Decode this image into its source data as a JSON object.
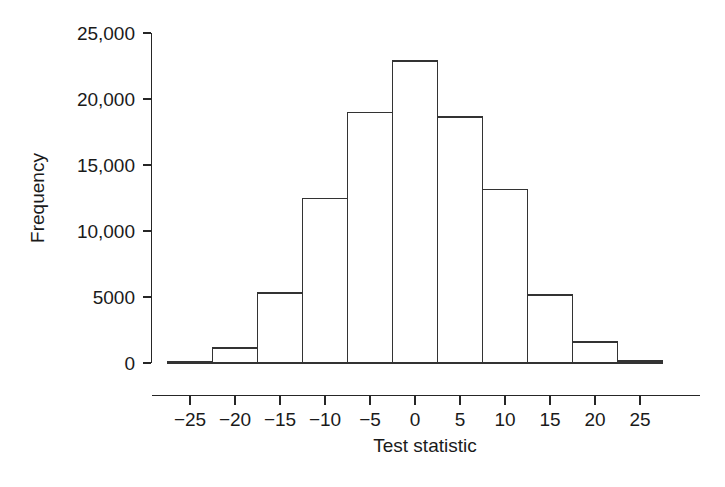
{
  "chart_data": {
    "type": "bar",
    "title": "",
    "xlabel": "Test statistic",
    "ylabel": "Frequency",
    "xlim": [
      -27.5,
      27.5
    ],
    "ylim": [
      0,
      25000
    ],
    "grid": false,
    "legend": null,
    "bin_width": 5,
    "xtick_values": [
      -25,
      -20,
      -15,
      -10,
      -5,
      0,
      5,
      10,
      15,
      20,
      25
    ],
    "xtick_labels": [
      "−25",
      "−20",
      "−15",
      "−10",
      "−5",
      "0",
      "5",
      "10",
      "15",
      "20",
      "25"
    ],
    "ytick_values": [
      0,
      5000,
      10000,
      15000,
      20000,
      25000
    ],
    "ytick_labels": [
      "0",
      "5000",
      "10,000",
      "15,000",
      "20,000",
      "25,000"
    ],
    "bins": [
      {
        "left": -27.5,
        "right": -22.5,
        "center": -25,
        "value": 120
      },
      {
        "left": -22.5,
        "right": -17.5,
        "center": -20,
        "value": 1150
      },
      {
        "left": -17.5,
        "right": -12.5,
        "center": -15,
        "value": 5300
      },
      {
        "left": -12.5,
        "right": -7.5,
        "center": -10,
        "value": 12450
      },
      {
        "left": -7.5,
        "right": -2.5,
        "center": -5,
        "value": 19000
      },
      {
        "left": -2.5,
        "right": 2.5,
        "center": 0,
        "value": 22880
      },
      {
        "left": 2.5,
        "right": 7.5,
        "center": 5,
        "value": 18650
      },
      {
        "left": 7.5,
        "right": 12.5,
        "center": 10,
        "value": 13150
      },
      {
        "left": 12.5,
        "right": 17.5,
        "center": 15,
        "value": 5150
      },
      {
        "left": 17.5,
        "right": 22.5,
        "center": 20,
        "value": 1600
      },
      {
        "left": 22.5,
        "right": 27.5,
        "center": 25,
        "value": 150
      }
    ],
    "categories": [
      "-25",
      "-20",
      "-15",
      "-10",
      "-5",
      "0",
      "5",
      "10",
      "15",
      "20",
      "25"
    ],
    "values": [
      120,
      1150,
      5300,
      12450,
      19000,
      22880,
      18650,
      13150,
      5150,
      1600,
      150
    ],
    "colors": {
      "bar_stroke": "#333333",
      "bar_fill": "none",
      "axis": "#262626",
      "text": "#1a1a1a",
      "background": "#ffffff"
    }
  }
}
